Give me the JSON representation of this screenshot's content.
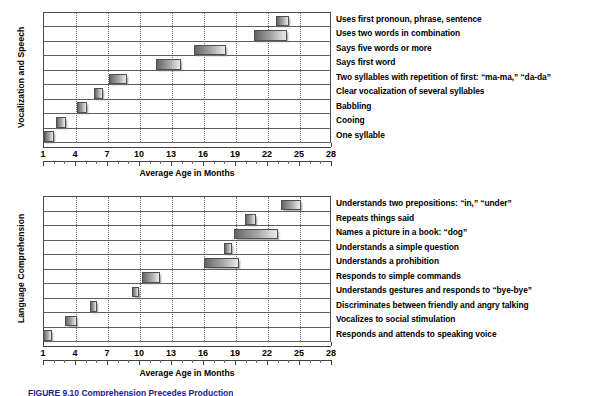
{
  "figure": {
    "caption": "FIGURE 9.10  Comprehension Precedes Production",
    "axis_title": "Average Age in Months",
    "x_major_ticks": [
      1,
      4,
      7,
      10,
      13,
      16,
      19,
      22,
      25,
      28
    ],
    "x_min": 1,
    "x_max": 28
  },
  "chart_data": [
    {
      "type": "bar",
      "orientation": "horizontal-range",
      "title": "Vocalization and Speech",
      "ylabel": "Vocalization and Speech",
      "xlabel": "Average Age in Months",
      "xlim": [
        1,
        28
      ],
      "grid": true,
      "legend": "none",
      "units": "months",
      "note": "Each bar is a range: approximate onset age span for the milestone.",
      "categories": [
        "Uses first pronoun, phrase, sentence",
        "Uses two words in combination",
        "Says five words or more",
        "Says first word",
        "Two syllables with repetition of first: “ma-ma,” “da-da”",
        "Clear vocalization of several syllables",
        "Babbling",
        "Cooing",
        "One syllable"
      ],
      "ranges": [
        [
          22.8,
          24.1
        ],
        [
          20.8,
          23.9
        ],
        [
          15.2,
          18.2
        ],
        [
          11.6,
          13.9
        ],
        [
          7.2,
          8.9
        ],
        [
          5.8,
          6.6
        ],
        [
          4.2,
          5.1
        ],
        [
          2.2,
          3.2
        ],
        [
          1.1,
          2.0
        ]
      ]
    },
    {
      "type": "bar",
      "orientation": "horizontal-range",
      "title": "Language Comprehension",
      "ylabel": "Language Comprehension",
      "xlabel": "Average Age in Months",
      "xlim": [
        1,
        28
      ],
      "grid": true,
      "legend": "none",
      "units": "months",
      "note": "Each bar is a range: approximate onset age span for the milestone.",
      "categories": [
        "Understands two prepositions: “in,” “under”",
        "Repeats things said",
        "Names a picture in a book: “dog”",
        "Understands a simple question",
        "Understands a prohibition",
        "Responds to simple commands",
        "Understands gestures and responds to “bye-bye”",
        "Discriminates between friendly and angry talking",
        "Vocalizes to social stimulation",
        "Responds and attends to speaking voice"
      ],
      "ranges": [
        [
          23.3,
          25.2
        ],
        [
          19.9,
          21.0
        ],
        [
          18.9,
          23.0
        ],
        [
          18.0,
          18.7
        ],
        [
          16.1,
          19.4
        ],
        [
          10.3,
          12.0
        ],
        [
          9.3,
          10.0
        ],
        [
          5.4,
          6.1
        ],
        [
          3.1,
          4.2
        ],
        [
          1.0,
          1.8
        ]
      ]
    }
  ]
}
